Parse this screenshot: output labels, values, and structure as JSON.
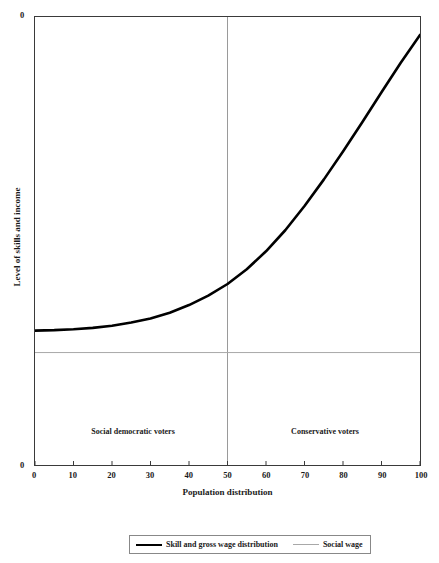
{
  "chart_data": {
    "type": "line",
    "title": "",
    "xlabel": "Population distribution",
    "ylabel": "Level of skills and income",
    "xlim": [
      0,
      100
    ],
    "ylim": [
      0,
      1
    ],
    "grid": false,
    "legend_position": "bottom",
    "y_axis_tick_labels": [
      "0",
      "0"
    ],
    "x_tick_labels": [
      "0",
      "10",
      "20",
      "30",
      "40",
      "50",
      "60",
      "70",
      "80",
      "90",
      "100"
    ],
    "x_tick_values": [
      0,
      10,
      20,
      30,
      40,
      50,
      60,
      70,
      80,
      90,
      100
    ],
    "series": [
      {
        "name": "Skill and gross wage distribution",
        "style": "thick-black-curve",
        "color": "#000000",
        "x": [
          0,
          5,
          10,
          15,
          20,
          25,
          30,
          35,
          40,
          45,
          50,
          55,
          60,
          65,
          70,
          75,
          80,
          85,
          90,
          95,
          100
        ],
        "y": [
          0.3,
          0.301,
          0.303,
          0.306,
          0.311,
          0.318,
          0.327,
          0.34,
          0.357,
          0.378,
          0.404,
          0.437,
          0.477,
          0.524,
          0.578,
          0.637,
          0.7,
          0.765,
          0.832,
          0.898,
          0.96
        ]
      },
      {
        "name": "Social wage",
        "style": "thin-horizontal-line",
        "color": "#a8a8a8",
        "x": [
          0,
          100
        ],
        "y": [
          0.251,
          0.251
        ]
      }
    ],
    "reference_lines": [
      {
        "name": "voter-split-divider",
        "orientation": "vertical",
        "x": 50,
        "color": "#9a9a9a"
      }
    ],
    "annotations": [
      {
        "text": "Social democratic voters",
        "x": 25,
        "y": 0.08
      },
      {
        "text": "Conservative voters",
        "x": 75,
        "y": 0.08
      }
    ],
    "legend_entries": [
      {
        "label": "Skill and gross wage distribution",
        "swatch": "thick"
      },
      {
        "label": "Social wage",
        "swatch": "thin"
      }
    ]
  },
  "axes": {
    "y_top_value": "0",
    "y_bottom_value": "0",
    "y_title": "Level of skills and income",
    "x_title": "Population distribution"
  },
  "ticks": {
    "x": [
      {
        "label": "0",
        "value": 0
      },
      {
        "label": "10",
        "value": 10
      },
      {
        "label": "20",
        "value": 20
      },
      {
        "label": "30",
        "value": 30
      },
      {
        "label": "40",
        "value": 40
      },
      {
        "label": "50",
        "value": 50
      },
      {
        "label": "60",
        "value": 60
      },
      {
        "label": "70",
        "value": 70
      },
      {
        "label": "80",
        "value": 80
      },
      {
        "label": "90",
        "value": 90
      },
      {
        "label": "100",
        "value": 100
      }
    ]
  },
  "annotations": {
    "left": "Social democratic voters",
    "right": "Conservative voters"
  },
  "legend": {
    "items": [
      {
        "label": "Skill and gross wage distribution"
      },
      {
        "label": "Social wage"
      }
    ]
  },
  "colors": {
    "curve": "#000000",
    "social_wage_line": "#a8a8a8",
    "divider": "#9a9a9a",
    "frame": "#3a3a3a",
    "text": "#1a1a1a",
    "background": "#ffffff"
  }
}
